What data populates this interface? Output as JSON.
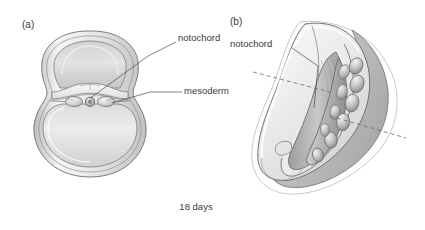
{
  "figure": {
    "caption": "18 days",
    "background_color": "#ffffff",
    "ink_color": "#4a4a4a",
    "fill_light": "#f2f2f2",
    "fill_mid": "#d8d8d8",
    "fill_dark": "#a8a8a8"
  },
  "panels": [
    {
      "id": "a",
      "id_label": "(a)",
      "view": "transverse cross-section",
      "labels": [
        {
          "key": "notochord",
          "text": "notochord"
        },
        {
          "key": "mesoderm",
          "text": "mesoderm"
        }
      ],
      "structures": [
        "amniotic cavity",
        "embryonic disc",
        "notochord",
        "mesoderm",
        "yolk sac"
      ]
    },
    {
      "id": "b",
      "id_label": "(b)",
      "view": "dorsal three-dimensional view",
      "labels": [
        {
          "key": "notochord",
          "text": "notochord"
        }
      ],
      "structures": [
        "embryonic disc",
        "notochord",
        "somites",
        "section plane"
      ]
    }
  ]
}
